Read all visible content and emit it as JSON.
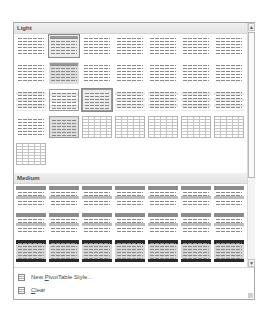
{
  "gallery": {
    "sections": [
      {
        "label": "Light",
        "rows": [
          [
            "plain",
            "selected-headbar",
            "plain",
            "plain",
            "plain",
            "plain",
            "plain"
          ],
          [
            "plain",
            "grey-headbar",
            "plain",
            "plain",
            "plain",
            "plain",
            "plain"
          ],
          [
            "banded",
            "banded-bordered",
            "selected-bordered",
            "banded",
            "banded",
            "banded",
            "banded"
          ],
          [
            "plain",
            "grey-bordered",
            "gridlines",
            "gridlines",
            "gridlines",
            "gridlines",
            "gridlines"
          ],
          [
            "gridlines"
          ]
        ]
      },
      {
        "label": "Medium",
        "rows": [
          [
            "medhead",
            "medhead",
            "medhead",
            "medhead",
            "medhead",
            "medhead",
            "medhead"
          ],
          [
            "medhead",
            "medhead",
            "medhead",
            "medhead",
            "medhead",
            "medhead",
            "medhead"
          ],
          [
            "darkhead",
            "darkhead",
            "darkhead",
            "darkhead",
            "darkhead",
            "darkhead",
            "darkhead"
          ]
        ]
      }
    ],
    "scroll_up": "▲",
    "scroll_down": "▼"
  },
  "menu": {
    "new_style": {
      "prefix": "New ",
      "accel": "P",
      "suffix": "ivotTable Style..."
    },
    "clear": {
      "prefix": "",
      "accel": "C",
      "suffix": "lear"
    }
  }
}
